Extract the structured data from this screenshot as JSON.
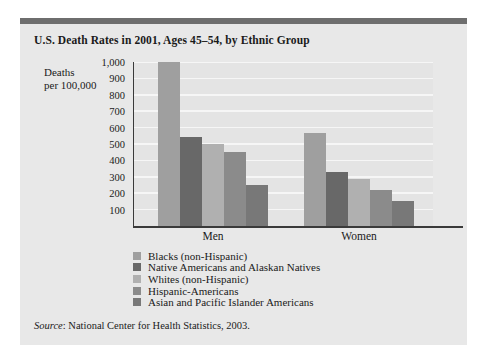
{
  "card": {
    "title": "U.S. Death Rates in 2001, Ages 45–54, by Ethnic Group",
    "source_prefix": "Source",
    "source_text": ": National Center for Health Statistics, 2003."
  },
  "axis_label": {
    "line1": "Deaths",
    "line2": "per 100,000"
  },
  "colors": {
    "card_background": "#e8e8e8",
    "plot_background": "#e4e4e4",
    "accent_bar": "#6e6e6e",
    "gridline": "#f6f6f6",
    "axis": "#3a3a3a",
    "text": "#1a1a1a"
  },
  "chart_data": {
    "type": "bar",
    "title": "U.S. Death Rates in 2001, Ages 45–54, by Ethnic Group",
    "xlabel": "",
    "ylabel": "Deaths per 100,000",
    "ylim": [
      0,
      1000
    ],
    "yticks": [
      100,
      200,
      300,
      400,
      500,
      600,
      700,
      800,
      900,
      1000
    ],
    "ytick_labels": [
      "100",
      "200",
      "300",
      "400",
      "500",
      "600",
      "700",
      "800",
      "900",
      "1,000"
    ],
    "grid": true,
    "legend_position": "below",
    "categories": [
      "Men",
      "Women"
    ],
    "series": [
      {
        "name": "Blacks (non-Hispanic)",
        "color": "#9f9f9f",
        "values": [
          1000,
          570
        ]
      },
      {
        "name": "Native Americans and Alaskan Natives",
        "color": "#686868",
        "values": [
          540,
          330
        ]
      },
      {
        "name": "Whites (non-Hispanic)",
        "color": "#b0b0b0",
        "values": [
          500,
          285
        ]
      },
      {
        "name": "Hispanic-Americans",
        "color": "#8b8b8b",
        "values": [
          450,
          220
        ]
      },
      {
        "name": "Asian and Pacific Islander Americans",
        "color": "#787878",
        "values": [
          250,
          155
        ]
      }
    ]
  }
}
